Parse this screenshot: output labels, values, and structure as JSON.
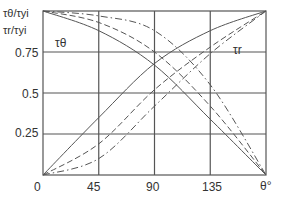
{
  "chart_data": {
    "type": "line",
    "title": "",
    "xlabel": "θ°",
    "ylabel": "τθ/τyi, τr/τyi",
    "ylabel_lines": [
      "τθ/τyi",
      "τr/τyi"
    ],
    "xlim": [
      0,
      180
    ],
    "ylim": [
      0,
      1
    ],
    "grid": true,
    "x_ticks": [
      "0",
      "45",
      "90",
      "135",
      "θ°"
    ],
    "y_ticks": [
      "0.25",
      "0.5",
      "0.75"
    ],
    "annotations": [
      "τθ",
      "τr"
    ],
    "x": [
      0,
      45,
      90,
      135,
      180
    ],
    "series": [
      {
        "name": "τθ (solid)",
        "style": "solid",
        "values": [
          1.0,
          0.88,
          0.67,
          0.34,
          0.0
        ]
      },
      {
        "name": "τr (solid)",
        "style": "solid",
        "values": [
          0.0,
          0.35,
          0.68,
          0.88,
          1.0
        ]
      },
      {
        "name": "τθ (dashed)",
        "style": "dashed",
        "values": [
          1.0,
          0.93,
          0.75,
          0.42,
          0.0
        ]
      },
      {
        "name": "τr (dashed)",
        "style": "dashed",
        "values": [
          0.0,
          0.19,
          0.52,
          0.78,
          1.0
        ]
      },
      {
        "name": "τθ (dash-dot)",
        "style": "dashdot",
        "values": [
          1.0,
          0.97,
          0.88,
          0.55,
          0.0
        ]
      },
      {
        "name": "τr (dash-dot)",
        "style": "dashdot",
        "values": [
          0.0,
          0.1,
          0.42,
          0.74,
          1.0
        ]
      }
    ]
  },
  "labels": {
    "y_top_1": "τθ/τyi",
    "y_top_2": "τr/τyi",
    "tick_075": "0.75",
    "tick_05": "0.5",
    "tick_025": "0.25",
    "x0": "0",
    "x45": "45",
    "x90": "90",
    "x135": "135",
    "x180": "θ°",
    "ann_theta": "τθ",
    "ann_r": "τr"
  }
}
